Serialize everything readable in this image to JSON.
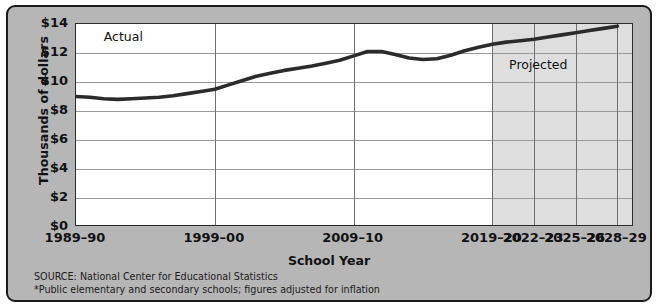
{
  "chart_data": {
    "type": "line",
    "title": "",
    "xlabel": "School Year",
    "ylabel": "Thousands of dollars",
    "ylim": [
      0,
      14
    ],
    "ytick_labels": [
      "$14",
      "$12",
      "$10",
      "$8",
      "$6",
      "$4",
      "$2",
      "$0"
    ],
    "ytick_values": [
      14,
      12,
      10,
      8,
      6,
      4,
      2,
      0
    ],
    "xtick_labels": [
      "1989–90",
      "1999–00",
      "2009–10",
      "2019–20",
      "2022–23",
      "2025–26",
      "2028–29"
    ],
    "xtick_values": [
      1989,
      1999,
      2009,
      2019,
      2022,
      2025,
      2028
    ],
    "grid": true,
    "legend_position": "none",
    "annotations": [
      {
        "text": "Actual",
        "x": 1991,
        "y": 13.1
      },
      {
        "text": "Projected",
        "x": 2020.2,
        "y": 11.2
      }
    ],
    "projected_start": 2019,
    "series": [
      {
        "name": "Expenditure per pupil",
        "x": [
          1989,
          1990,
          1991,
          1992,
          1993,
          1994,
          1995,
          1996,
          1997,
          1998,
          1999,
          2000,
          2001,
          2002,
          2003,
          2004,
          2005,
          2006,
          2007,
          2008,
          2009,
          2010,
          2011,
          2012,
          2013,
          2014,
          2015,
          2016,
          2017,
          2018,
          2019,
          2020,
          2021,
          2022,
          2023,
          2024,
          2025,
          2026,
          2027,
          2028
        ],
        "values": [
          9.0,
          8.95,
          8.85,
          8.8,
          8.85,
          8.9,
          8.95,
          9.05,
          9.2,
          9.35,
          9.5,
          9.8,
          10.1,
          10.4,
          10.6,
          10.8,
          10.95,
          11.1,
          11.3,
          11.5,
          11.8,
          12.1,
          12.1,
          11.9,
          11.65,
          11.55,
          11.6,
          11.85,
          12.15,
          12.4,
          12.6,
          12.75,
          12.85,
          12.95,
          13.1,
          13.25,
          13.4,
          13.55,
          13.7,
          13.85
        ]
      }
    ],
    "source": "SOURCE: National Center for Educational Statistics",
    "note": "*Public elementary and secondary schools; figures adjusted for inflation"
  },
  "axes": {
    "y_title": "Thousands of dollars",
    "x_title": "School Year"
  },
  "annotations": {
    "actual": "Actual",
    "projected": "Projected"
  },
  "footnotes": {
    "source": "SOURCE: National Center for Educational Statistics",
    "note": "*Public elementary and secondary schools; figures adjusted for inflation"
  },
  "colors": {
    "panel": "#b6b6b6",
    "plot_bg": "#ffffff",
    "projected_bg": "#dedede",
    "line": "#2b2b2b",
    "grid": "#9a9a9a",
    "border": "#1b1b1b"
  }
}
